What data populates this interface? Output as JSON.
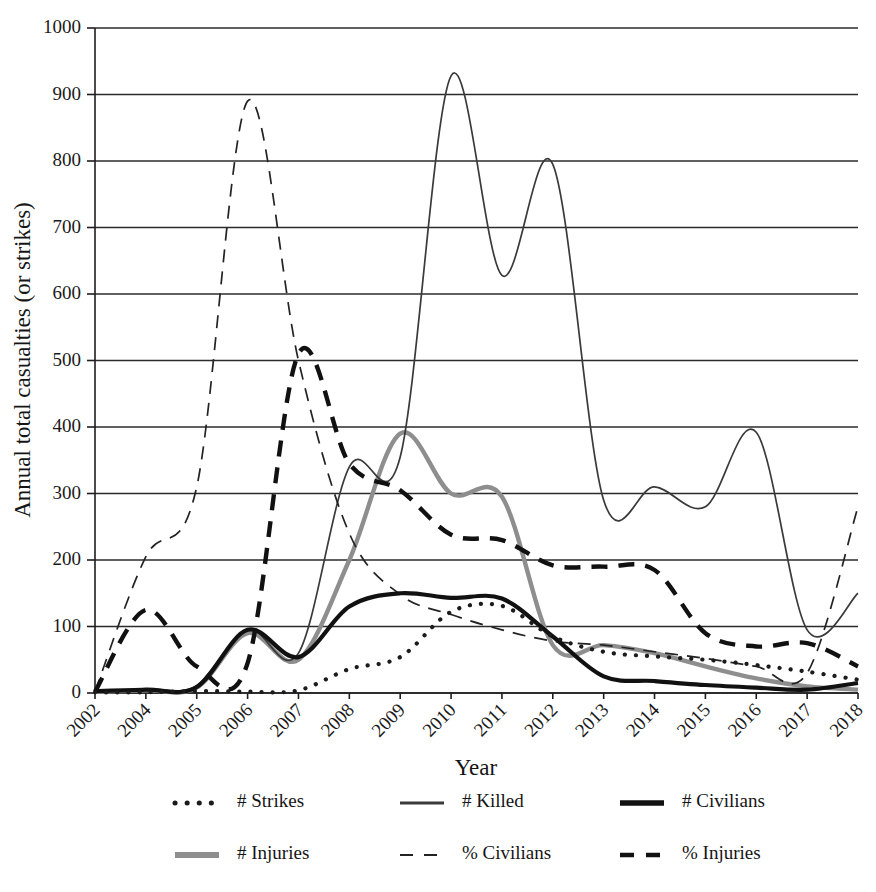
{
  "chart_data": {
    "type": "line",
    "title": "",
    "xlabel": "Year",
    "ylabel": "Annual total casualties (or strikes)",
    "ylim": [
      0,
      1000
    ],
    "ytick_step": 100,
    "grid": true,
    "legend_position": "bottom",
    "categories": [
      "2002",
      "2004",
      "2005",
      "2006",
      "2007",
      "2008",
      "2009",
      "2010",
      "2011",
      "2012",
      "2013",
      "2014",
      "2015",
      "2016",
      "2017",
      "2018"
    ],
    "yticks": [
      "0",
      "100",
      "200",
      "300",
      "400",
      "500",
      "600",
      "700",
      "800",
      "900",
      "1000"
    ],
    "series": [
      {
        "name": "# Strikes",
        "style": "dotted",
        "values": [
          1,
          1,
          3,
          2,
          4,
          36,
          54,
          122,
          131,
          85,
          62,
          55,
          50,
          42,
          32,
          20
        ]
      },
      {
        "name": "# Killed",
        "style": "thin-solid",
        "values": [
          3,
          6,
          11,
          96,
          60,
          340,
          355,
          928,
          628,
          795,
          290,
          310,
          280,
          392,
          95,
          150
        ]
      },
      {
        "name": "# Civilians",
        "style": "thick-solid",
        "values": [
          3,
          5,
          9,
          95,
          54,
          130,
          150,
          143,
          142,
          85,
          25,
          18,
          12,
          8,
          5,
          15
        ]
      },
      {
        "name": "# Injuries",
        "style": "thick-gray-solid",
        "values": [
          2,
          4,
          8,
          90,
          50,
          200,
          390,
          300,
          295,
          72,
          72,
          60,
          40,
          22,
          10,
          5
        ]
      },
      {
        "name": "% Civilians",
        "style": "thin-dashed",
        "values": [
          2,
          205,
          310,
          890,
          500,
          240,
          148,
          118,
          95,
          78,
          72,
          62,
          52,
          40,
          30,
          280
        ]
      },
      {
        "name": "% Injuries",
        "style": "thick-dashed",
        "values": [
          2,
          125,
          40,
          45,
          510,
          345,
          305,
          238,
          230,
          192,
          190,
          185,
          90,
          70,
          75,
          40
        ]
      }
    ],
    "annotations": {
      "note": "Chart plotted with smoothed curves; x-axis labels skip 2003."
    }
  },
  "legend": {
    "entries": [
      {
        "label": "# Strikes",
        "icon": "dotted-line-swatch"
      },
      {
        "label": "# Killed",
        "icon": "thin-solid-line-swatch"
      },
      {
        "label": "# Civilians",
        "icon": "thick-solid-line-swatch"
      },
      {
        "label": "# Injuries",
        "icon": "thick-gray-line-swatch"
      },
      {
        "label": "% Civilians",
        "icon": "thin-dashed-line-swatch"
      },
      {
        "label": "% Injuries",
        "icon": "thick-dashed-line-swatch"
      }
    ]
  },
  "colors": {
    "axis": "#1d1d1d",
    "grid": "#2b2b2b",
    "strikes": "#1b1b1b",
    "killed": "#3a3a3a",
    "civilians": "#111111",
    "injuries": "#8e8e8e",
    "pct_civilians": "#232323",
    "pct_injuries": "#111111",
    "background": "#ffffff"
  }
}
